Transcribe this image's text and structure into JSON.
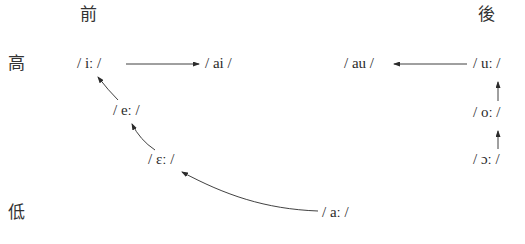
{
  "axes": {
    "front": "前",
    "back": "後",
    "high": "高",
    "low": "低"
  },
  "phonemes": {
    "i_long": "/ iː /",
    "ai": "/ ai /",
    "e_long": "/ eː /",
    "epsilon_long": "/ ɛː /",
    "a_long": "/ aː /",
    "au": "/ au /",
    "u_long": "/ uː /",
    "o_long": "/ oː /",
    "open_o_long": "/ ɔː /"
  },
  "arrows": [
    {
      "from": "/ iː /",
      "to": "/ ai /"
    },
    {
      "from": "/ eː /",
      "to": "/ iː /"
    },
    {
      "from": "/ ɛː /",
      "to": "/ eː /"
    },
    {
      "from": "/ aː /",
      "to": "/ ɛː /"
    },
    {
      "from": "/ uː /",
      "to": "/ au /"
    },
    {
      "from": "/ oː /",
      "to": "/ uː /"
    },
    {
      "from": "/ ɔː /",
      "to": "/ oː /"
    }
  ],
  "colors": {
    "ink": "#2b2b2b",
    "background": "#ffffff"
  }
}
